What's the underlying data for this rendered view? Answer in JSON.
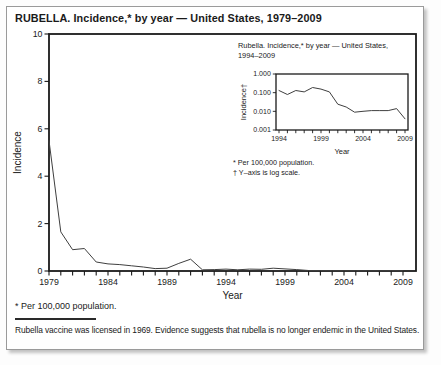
{
  "figure": {
    "title": "RUBELLA. Incidence,* by year — United States, 1979–2009",
    "footnote_population": "* Per 100,000 population.",
    "note": "Rubella vaccine was licensed in 1969. Evidence suggests that rubella is no longer endemic in the United States."
  },
  "colors": {
    "line": "#3f3f3f",
    "axis": "#1a1a1a",
    "text": "#1a1a1a",
    "panel_border": "#9a9a9a",
    "shadow": "#c2c2c2",
    "background": "#ffffff"
  },
  "chart_data": [
    {
      "id": "main",
      "type": "line",
      "title": "RUBELLA. Incidence,* by year — United States, 1979–2009",
      "xlabel": "Year",
      "ylabel": "Incidence",
      "yscale": "linear",
      "ylim": [
        0,
        10
      ],
      "yticks": [
        0,
        2,
        4,
        6,
        8,
        10
      ],
      "xticks": [
        1979,
        1984,
        1989,
        1994,
        1999,
        2004,
        2009
      ],
      "x": [
        1979,
        1980,
        1981,
        1982,
        1983,
        1984,
        1985,
        1986,
        1987,
        1988,
        1989,
        1990,
        1991,
        1992,
        1993,
        1994,
        1995,
        1996,
        1997,
        1998,
        1999,
        2000,
        2001,
        2002,
        2003,
        2004,
        2005,
        2006,
        2007,
        2008,
        2009
      ],
      "values": [
        5.5,
        1.65,
        0.9,
        0.95,
        0.38,
        0.3,
        0.27,
        0.22,
        0.17,
        0.1,
        0.12,
        0.32,
        0.5,
        0.05,
        0.06,
        0.08,
        0.05,
        0.08,
        0.07,
        0.12,
        0.09,
        0.06,
        0.02,
        0.015,
        0.01,
        0.01,
        0.01,
        0.01,
        0.01,
        0.012,
        0.004
      ]
    },
    {
      "id": "inset",
      "type": "line",
      "title_lines": [
        "Rubella. Incidence,* by year — United States,",
        "1994–2009"
      ],
      "xlabel": "Year",
      "ylabel": "Incidence†",
      "yscale": "log",
      "ylim": [
        0.001,
        1.0
      ],
      "yticks": [
        {
          "label": "1.000",
          "value": 1.0
        },
        {
          "label": "0.100",
          "value": 0.1
        },
        {
          "label": "0.010",
          "value": 0.01
        },
        {
          "label": "0.001",
          "value": 0.001
        }
      ],
      "xticks": [
        1994,
        1999,
        2004,
        2009
      ],
      "x": [
        1994,
        1995,
        1996,
        1997,
        1998,
        1999,
        2000,
        2001,
        2002,
        2003,
        2004,
        2005,
        2006,
        2007,
        2008,
        2009
      ],
      "values": [
        0.13,
        0.08,
        0.13,
        0.11,
        0.19,
        0.155,
        0.11,
        0.024,
        0.017,
        0.009,
        0.01,
        0.011,
        0.011,
        0.011,
        0.014,
        0.004
      ],
      "footnotes": [
        "* Per 100,000 population.",
        "† Y–axis is log scale."
      ]
    }
  ]
}
